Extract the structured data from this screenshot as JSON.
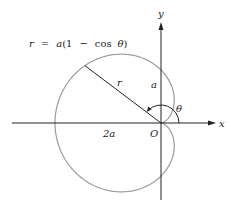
{
  "diagram": {
    "equation": {
      "r": "r",
      "eq": "=",
      "a": "a",
      "open": "(1",
      "minus": "−",
      "cos": "cos",
      "theta": "θ",
      "close": ")"
    },
    "labels": {
      "y_axis": "y",
      "x_axis": "x",
      "origin": "O",
      "radius": "r",
      "a_length": "a",
      "two_a": "2a",
      "angle": "θ"
    },
    "geometry": {
      "origin_px": [
        161,
        123
      ],
      "a_px": 53,
      "radius_angle_deg": 143,
      "angle_arc_radius_px": 18
    },
    "colors": {
      "curve": "#9a9a9a",
      "axes": "#222222",
      "text": "#222222",
      "background": "#ffffff"
    }
  }
}
